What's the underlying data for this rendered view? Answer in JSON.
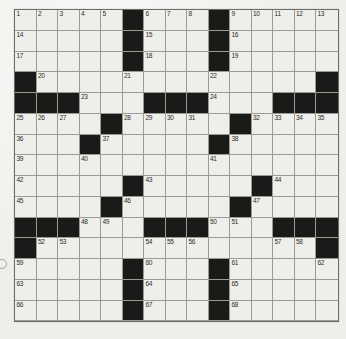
{
  "colors": {
    "page_background": "#f2f2ef",
    "cell_background": "#eeeeea",
    "black_cell": "#1a1a18",
    "grid_line": "#9a9a96",
    "grid_border": "#6a6a66",
    "number_text": "#2e2e2c",
    "margin_mark": "#8d8d88"
  },
  "crossword": {
    "rows": 15,
    "cols": 15,
    "legend": "B = black square, 0 = empty white square, integer = clue number in white square",
    "grid": [
      [
        1,
        2,
        3,
        4,
        5,
        "B",
        6,
        7,
        8,
        "B",
        9,
        10,
        11,
        12,
        13
      ],
      [
        14,
        0,
        0,
        0,
        0,
        "B",
        15,
        0,
        0,
        "B",
        16,
        0,
        0,
        0,
        0
      ],
      [
        17,
        0,
        0,
        0,
        0,
        "B",
        18,
        0,
        0,
        "B",
        19,
        0,
        0,
        0,
        0
      ],
      [
        "B",
        20,
        0,
        0,
        0,
        21,
        0,
        0,
        0,
        22,
        0,
        0,
        0,
        0,
        "B"
      ],
      [
        "B",
        "B",
        "B",
        23,
        0,
        0,
        "B",
        "B",
        "B",
        24,
        0,
        0,
        "B",
        "B",
        "B"
      ],
      [
        25,
        26,
        27,
        0,
        "B",
        28,
        29,
        30,
        31,
        0,
        "B",
        32,
        33,
        34,
        35
      ],
      [
        36,
        0,
        0,
        "B",
        37,
        0,
        0,
        0,
        0,
        "B",
        38,
        0,
        0,
        0,
        0
      ],
      [
        39,
        0,
        0,
        40,
        0,
        0,
        0,
        0,
        0,
        41,
        0,
        0,
        0,
        0,
        0
      ],
      [
        42,
        0,
        0,
        0,
        0,
        "B",
        43,
        0,
        0,
        0,
        0,
        "B",
        44,
        0,
        0
      ],
      [
        45,
        0,
        0,
        0,
        "B",
        46,
        0,
        0,
        0,
        0,
        "B",
        47,
        0,
        0,
        0
      ],
      [
        "B",
        "B",
        "B",
        48,
        49,
        0,
        "B",
        "B",
        "B",
        50,
        51,
        0,
        "B",
        "B",
        "B"
      ],
      [
        "B",
        52,
        53,
        0,
        0,
        0,
        54,
        55,
        56,
        0,
        0,
        0,
        57,
        58,
        "B"
      ],
      [
        59,
        0,
        0,
        0,
        0,
        "B",
        60,
        0,
        0,
        "B",
        61,
        0,
        0,
        0,
        62
      ],
      [
        63,
        0,
        0,
        0,
        0,
        "B",
        64,
        0,
        0,
        "B",
        65,
        0,
        0,
        0,
        0
      ],
      [
        66,
        0,
        0,
        0,
        0,
        "B",
        67,
        0,
        0,
        "B",
        68,
        0,
        0,
        0,
        0
      ]
    ]
  },
  "margin_mark": {
    "shape": "small-partial-circle",
    "position": "left-edge-near-row-13"
  }
}
